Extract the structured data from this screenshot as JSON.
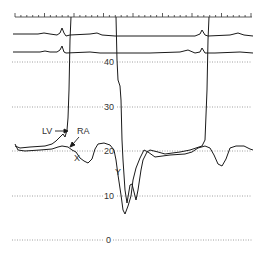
{
  "chart_data": {
    "type": "line",
    "title": "",
    "xlabel": "",
    "ylabel": "Pressure (mmHg)",
    "ylim": [
      0,
      45
    ],
    "y_ticks": [
      "0",
      "10",
      "20",
      "30",
      "40"
    ],
    "grid": "dotted horizontal",
    "annotations": [
      "LV",
      "RA",
      "X",
      "Y"
    ],
    "series": [
      {
        "name": "LV",
        "description": "Left ventricular pressure; rises steeply above 40 mmHg in systole, falls to ~9 mmHg (dip-and-plateau), plateaus ~20 mmHg in diastole"
      },
      {
        "name": "RA",
        "description": "Right atrial pressure ~20 mmHg with prominent X and Y descents (Y to ~10 mmHg)"
      },
      {
        "name": "ECG-1",
        "description": "Top ECG lead"
      },
      {
        "name": "ECG-2",
        "description": "Second ECG lead"
      }
    ]
  },
  "labels": {
    "y40": "40",
    "y30": "30",
    "y20": "20",
    "y10": "10",
    "y0": "0",
    "lv": "LV",
    "ra": "RA",
    "x": "X",
    "y": "Y"
  },
  "colors": {
    "trace": "#1a1a1a",
    "grid": "#777777"
  }
}
